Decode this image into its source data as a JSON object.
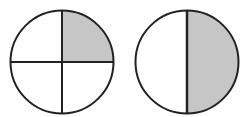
{
  "figure": {
    "stroke_color": "#222222",
    "fill_shaded": "#c6c6c6",
    "fill_unshaded": "#ffffff",
    "circles": [
      {
        "name": "quarters-circle",
        "parts": 4,
        "shaded_parts": 1,
        "fraction": "1/4",
        "shaded_region": "top-right quarter"
      },
      {
        "name": "halves-circle",
        "parts": 2,
        "shaded_parts": 1,
        "fraction": "1/2",
        "shaded_region": "right half"
      }
    ]
  }
}
